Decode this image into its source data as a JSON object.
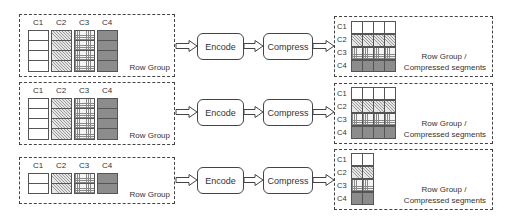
{
  "diagram": {
    "type": "columnstore-compression-pipeline",
    "column_labels": [
      "C1",
      "C2",
      "C3",
      "C4"
    ],
    "steps": [
      "Encode",
      "Compress"
    ],
    "input_label": "Row Group",
    "output_label_line1": "Row Group /",
    "output_label_line2": "Compressed segments",
    "column_patterns": {
      "C1": "blank",
      "C2": "diagonal-hatch",
      "C3": "grid-hatch",
      "C4": "solid-gray"
    },
    "colors": {
      "border": "#444444",
      "c4_fill": "#8c8c8c",
      "background": "#ffffff"
    },
    "row_groups": [
      {
        "id": 1,
        "input_rows": 4,
        "output_segments": 4
      },
      {
        "id": 2,
        "input_rows": 4,
        "output_segments": 4
      },
      {
        "id": 3,
        "input_rows": 2,
        "output_segments": 2
      }
    ]
  }
}
